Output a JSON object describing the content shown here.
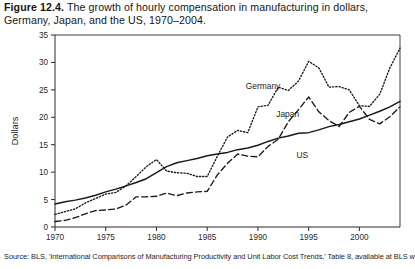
{
  "figure": {
    "number": "Figure 12.4.",
    "caption": "The growth of hourly compensation in manufacturing in dollars, Germany, Japan, and the US, 1970–2004."
  },
  "source": {
    "note": "Source: BLS, 'International Comparisons of Manufacturing Productivity and Unit Labor Cost Trends,' Table 8, available at BLS website."
  },
  "labels": {
    "germany": "Germany",
    "japan": "Japan",
    "us": "US"
  },
  "colors": {
    "ink": "#1a1a1a",
    "axis": "#2a2a2a",
    "background": "#ffffff"
  },
  "chart_data": {
    "type": "line",
    "title": "The growth of hourly compensation in manufacturing in dollars, Germany, Japan, and the US, 1970–2004",
    "xlabel": "",
    "ylabel": "Dollars",
    "xlim": [
      1970,
      2004
    ],
    "ylim": [
      0,
      35
    ],
    "yticks": [
      0,
      5,
      10,
      15,
      20,
      25,
      30,
      35
    ],
    "xticks": [
      1970,
      1975,
      1980,
      1985,
      1990,
      1995,
      2000
    ],
    "grid": false,
    "legend_position": "inline-annotations",
    "x": [
      1970,
      1971,
      1972,
      1973,
      1974,
      1975,
      1976,
      1977,
      1978,
      1979,
      1980,
      1981,
      1982,
      1983,
      1984,
      1985,
      1986,
      1987,
      1988,
      1989,
      1990,
      1991,
      1992,
      1993,
      1994,
      1995,
      1996,
      1997,
      1998,
      1999,
      2000,
      2001,
      2002,
      2003,
      2004
    ],
    "series": [
      {
        "name": "Germany",
        "style": "dotted",
        "values": [
          2.3,
          2.8,
          3.3,
          4.4,
          5.2,
          6.0,
          6.3,
          7.5,
          9.2,
          11.0,
          12.3,
          10.2,
          9.9,
          9.8,
          9.2,
          9.2,
          12.9,
          16.4,
          17.6,
          17.2,
          21.9,
          22.2,
          25.5,
          24.9,
          26.6,
          30.2,
          29.0,
          25.5,
          25.6,
          25.0,
          22.1,
          22.0,
          24.2,
          29.0,
          32.6
        ]
      },
      {
        "name": "Japan",
        "style": "dashed",
        "values": [
          1.0,
          1.2,
          1.7,
          2.4,
          3.0,
          3.1,
          3.3,
          4.0,
          5.5,
          5.5,
          5.6,
          6.2,
          5.7,
          6.2,
          6.4,
          6.5,
          9.5,
          11.6,
          13.3,
          12.9,
          12.8,
          14.7,
          16.0,
          19.2,
          21.4,
          23.7,
          21.0,
          19.4,
          18.3,
          20.9,
          22.0,
          19.6,
          18.8,
          20.1,
          21.9
        ]
      },
      {
        "name": "US",
        "style": "solid",
        "values": [
          4.2,
          4.6,
          4.9,
          5.3,
          5.8,
          6.4,
          6.9,
          7.5,
          8.1,
          8.8,
          9.9,
          11.0,
          11.7,
          12.1,
          12.5,
          13.0,
          13.3,
          13.6,
          14.1,
          14.4,
          14.9,
          15.6,
          16.2,
          16.6,
          17.1,
          17.2,
          17.7,
          18.3,
          18.7,
          19.2,
          19.7,
          20.4,
          21.1,
          21.9,
          22.9
        ]
      }
    ],
    "annotations": [
      {
        "text": "Germany",
        "x": 1989,
        "y": 25.5
      },
      {
        "text": "Japan",
        "x": 1992,
        "y": 20.5
      },
      {
        "text": "US",
        "x": 1994,
        "y": 13.0
      }
    ]
  }
}
